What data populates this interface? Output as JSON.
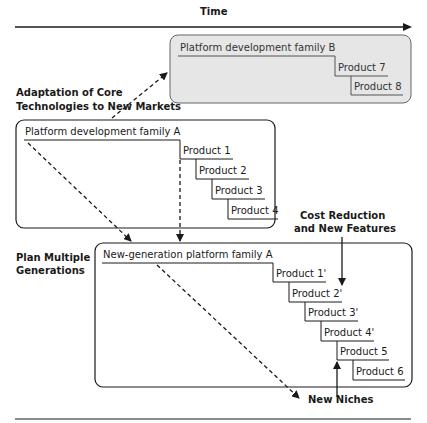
{
  "axis": {
    "time_label": "Time"
  },
  "annotations": {
    "adaptation_line1": "Adaptation of Core",
    "adaptation_line2": "Technologies to New Markets",
    "plan_line1": "Plan Multiple",
    "plan_line2": "Generations",
    "cost_line1": "Cost Reduction",
    "cost_line2": "and New Features",
    "new_niches": "New Niches"
  },
  "family_b": {
    "title": "Platform development family B",
    "products": [
      "Product 7",
      "Product 8"
    ],
    "fill": "#e6e6e6"
  },
  "family_a": {
    "title": "Platform development family A",
    "products": [
      "Product 1",
      "Product 2",
      "Product 3",
      "Product 4"
    ]
  },
  "family_a_next": {
    "title": "New-generation platform family A",
    "products": [
      "Product 1'",
      "Product 2'",
      "Product 3'",
      "Product 4'",
      "Product 5",
      "Product 6"
    ]
  },
  "colors": {
    "line": "#1a1a1a",
    "box_b_fill": "#e6e6e6",
    "box_b_stroke": "#666666"
  }
}
